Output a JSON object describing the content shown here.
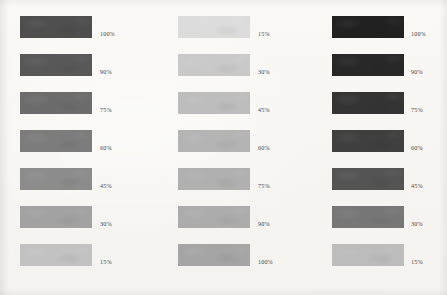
{
  "document": {
    "kind": "tint-density-reference-chart",
    "background_color": "#f8f7f4",
    "label_color": "#474441"
  },
  "layout": {
    "swatch_width": 72,
    "swatch_height": 22,
    "row_pitch": 38,
    "first_row_top": 16,
    "columns": [
      {
        "swatch_left": 20,
        "label_left": 100
      },
      {
        "swatch_left": 178,
        "label_left": 258
      },
      {
        "swatch_left": 332,
        "label_left": 411
      }
    ]
  },
  "chart_data": {
    "type": "table",
    "title": "",
    "subtitle": "",
    "xlabel": "",
    "ylabel": "",
    "grid": false,
    "legend": "none",
    "columns": [
      {
        "name": "column-1",
        "order": "dark-to-light",
        "swatches": [
          {
            "label": "100%",
            "value": 100,
            "color": "#4e4e4e"
          },
          {
            "label": "90%",
            "value": 90,
            "color": "#585858"
          },
          {
            "label": "75%",
            "value": 75,
            "color": "#6c6c6c"
          },
          {
            "label": "60%",
            "value": 60,
            "color": "#7c7c7c"
          },
          {
            "label": "45%",
            "value": 45,
            "color": "#8c8c8c"
          },
          {
            "label": "30%",
            "value": 30,
            "color": "#a2a2a2"
          },
          {
            "label": "15%",
            "value": 15,
            "color": "#c2c2c2"
          }
        ]
      },
      {
        "name": "column-2",
        "order": "light-to-dark",
        "swatches": [
          {
            "label": "15%",
            "value": 15,
            "color": "#dcdcdc"
          },
          {
            "label": "30%",
            "value": 30,
            "color": "#c9c9c9"
          },
          {
            "label": "45%",
            "value": 45,
            "color": "#bdbdbd"
          },
          {
            "label": "60%",
            "value": 60,
            "color": "#b4b4b4"
          },
          {
            "label": "75%",
            "value": 75,
            "color": "#b0b0b0"
          },
          {
            "label": "90%",
            "value": 90,
            "color": "#acacac"
          },
          {
            "label": "100%",
            "value": 100,
            "color": "#a5a5a5"
          }
        ]
      },
      {
        "name": "column-3",
        "order": "dark-to-light",
        "swatches": [
          {
            "label": "100%",
            "value": 100,
            "color": "#212121"
          },
          {
            "label": "90%",
            "value": 90,
            "color": "#282828"
          },
          {
            "label": "75%",
            "value": 75,
            "color": "#343434"
          },
          {
            "label": "60%",
            "value": 60,
            "color": "#3f3f3f"
          },
          {
            "label": "45%",
            "value": 45,
            "color": "#545454"
          },
          {
            "label": "30%",
            "value": 30,
            "color": "#777777"
          },
          {
            "label": "15%",
            "value": 15,
            "color": "#bcbcbc"
          }
        ]
      }
    ]
  }
}
